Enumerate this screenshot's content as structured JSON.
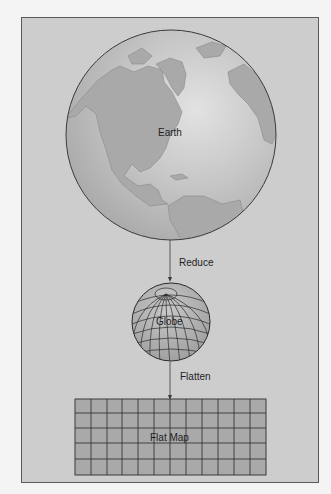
{
  "diagram": {
    "nodes": [
      {
        "id": "earth",
        "label": "Earth"
      },
      {
        "id": "globe",
        "label": "Globe"
      },
      {
        "id": "flat_map",
        "label": "Flat Map"
      }
    ],
    "edges": [
      {
        "from": "earth",
        "to": "globe",
        "label": "Reduce"
      },
      {
        "from": "globe",
        "to": "flat_map",
        "label": "Flatten"
      }
    ],
    "flat_map_grid": {
      "columns": 12,
      "rows": 5
    }
  },
  "colors": {
    "background": "#f4f4f4",
    "frame": "#cdcdcd",
    "earth_ocean": "#bdbdbd",
    "earth_land": "#a6a6a6",
    "globe_fill": "#b4b4b4",
    "map_fill": "#a9a9a9",
    "line": "#2a2a2a"
  }
}
